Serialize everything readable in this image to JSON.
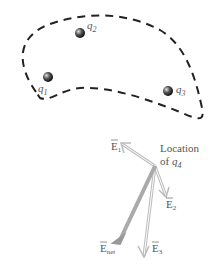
{
  "diagram": {
    "charges": [
      {
        "id": "q1",
        "name": "q",
        "sub": "1"
      },
      {
        "id": "q2",
        "name": "q",
        "sub": "2"
      },
      {
        "id": "q3",
        "name": "q",
        "sub": "3"
      }
    ],
    "location_label": {
      "line1": "Location",
      "line2": "of",
      "charge": "q",
      "sub": "4"
    },
    "vectors": [
      {
        "id": "E1",
        "symbol": "E",
        "sub": "1"
      },
      {
        "id": "E2",
        "symbol": "E",
        "sub": "2"
      },
      {
        "id": "E3",
        "symbol": "E",
        "sub": "3"
      },
      {
        "id": "Enet",
        "symbol": "E",
        "sub": "net"
      }
    ],
    "colors": {
      "outline": "#222222",
      "vector_stroke": "#bbbbbb",
      "net_vector": "#aaaaaa",
      "label": "#555555"
    }
  }
}
